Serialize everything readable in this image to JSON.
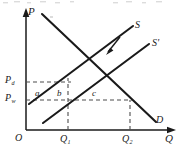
{
  "figure": {
    "axes": {
      "y_label": "P",
      "x_label": "Q",
      "origin_label": "O"
    },
    "y_ticks": [
      {
        "id": "pd",
        "label": "P",
        "sub": "d",
        "value_px": 82
      },
      {
        "id": "pw",
        "label": "P",
        "sub": "w",
        "value_px": 100
      }
    ],
    "x_ticks": [
      {
        "id": "q1",
        "label": "Q",
        "sub": "1",
        "value_px": 68
      },
      {
        "id": "q2",
        "label": "Q",
        "sub": "2",
        "value_px": 130
      }
    ],
    "curves": [
      {
        "id": "supply",
        "label": "S",
        "prime": ""
      },
      {
        "id": "supply_shifted",
        "label": "S",
        "prime": "'"
      },
      {
        "id": "demand",
        "label": "D",
        "prime": ""
      }
    ],
    "areas": [
      {
        "id": "area-a",
        "label": "a"
      },
      {
        "id": "area-b",
        "label": "b"
      },
      {
        "id": "area-c",
        "label": "c"
      }
    ],
    "shift_arrow": {
      "name": "supply-shift-arrow",
      "direction": "down-left"
    },
    "colors": {
      "line": "#1a1a1a",
      "dashed": "#555555",
      "background": "#ffffff",
      "noise": "#d9d9d9"
    }
  }
}
